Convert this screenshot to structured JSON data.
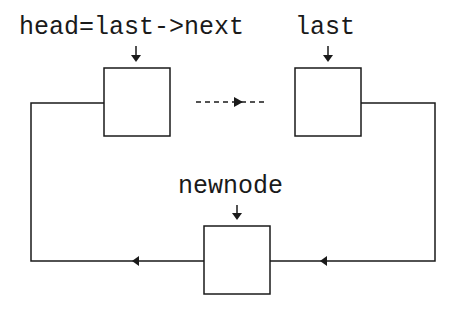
{
  "diagram": {
    "type": "circular-linked-list-insertion",
    "labels": {
      "head": "head=last->next",
      "last": "last",
      "newnode": "newnode"
    },
    "nodes": [
      {
        "id": "head-node",
        "pointer_label": "head=last->next"
      },
      {
        "id": "last-node",
        "pointer_label": "last"
      },
      {
        "id": "new-node",
        "pointer_label": "newnode"
      }
    ],
    "edges": [
      {
        "from": "head-node",
        "to": "last-node",
        "style": "dashed",
        "meaning": "intermediate nodes"
      },
      {
        "from": "last-node",
        "to": "new-node",
        "style": "solid"
      },
      {
        "from": "new-node",
        "to": "head-node",
        "style": "solid"
      }
    ],
    "colors": {
      "stroke": "#1a1a1a",
      "background": "#ffffff"
    }
  }
}
